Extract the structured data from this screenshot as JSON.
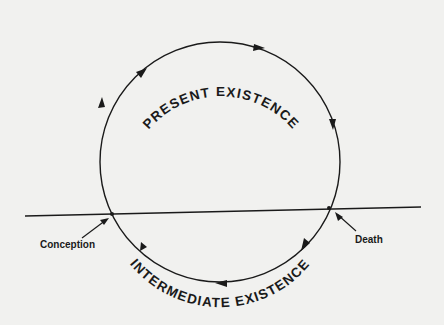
{
  "diagram": {
    "type": "cycle",
    "top_label": "PRESENT EXISTENCE",
    "bottom_label": "INTERMEDIATE EXISTENCE",
    "left_point_label": "Conception",
    "right_point_label": "Death",
    "direction": "clockwise",
    "nodes": [
      "Conception",
      "Present Existence",
      "Death",
      "Intermediate Existence"
    ],
    "edges": [
      {
        "from": "Conception",
        "to": "Death",
        "via": "Present Existence"
      },
      {
        "from": "Death",
        "to": "Conception",
        "via": "Intermediate Existence"
      }
    ],
    "colors": {
      "background": "#f1f1ef",
      "ink": "#1a1a1a"
    }
  }
}
